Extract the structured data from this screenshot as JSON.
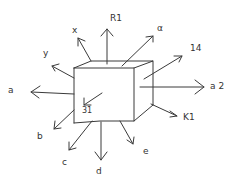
{
  "diagram": {
    "center_label": "31",
    "arrows": [
      {
        "id": "r1",
        "label": "R1",
        "direction": "up"
      },
      {
        "id": "x",
        "label": "x",
        "direction": "up-left"
      },
      {
        "id": "y",
        "label": "y",
        "direction": "left-up"
      },
      {
        "id": "alpha",
        "label": "α",
        "direction": "up-right"
      },
      {
        "id": "n14",
        "label": "14",
        "direction": "right-up"
      },
      {
        "id": "a",
        "label": "a",
        "direction": "left"
      },
      {
        "id": "a2",
        "label": "a 2",
        "direction": "right"
      },
      {
        "id": "k1",
        "label": "K1",
        "direction": "down-right"
      },
      {
        "id": "b",
        "label": "b",
        "direction": "down-left"
      },
      {
        "id": "c",
        "label": "c",
        "direction": "down-left"
      },
      {
        "id": "d",
        "label": "d",
        "direction": "down"
      },
      {
        "id": "e",
        "label": "e",
        "direction": "down-right"
      }
    ]
  }
}
